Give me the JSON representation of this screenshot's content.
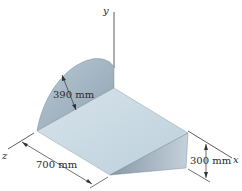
{
  "figure": {
    "axes": {
      "x": "x",
      "y": "y",
      "z": "z"
    },
    "dimensions": {
      "radius": "390 mm",
      "length": "700 mm",
      "height": "300 mm"
    },
    "colors": {
      "quarter_disk": "#a8b9c6",
      "top_face": "#c9d9e3",
      "side_triangle": "#9fb0bd",
      "line": "#333333"
    }
  }
}
